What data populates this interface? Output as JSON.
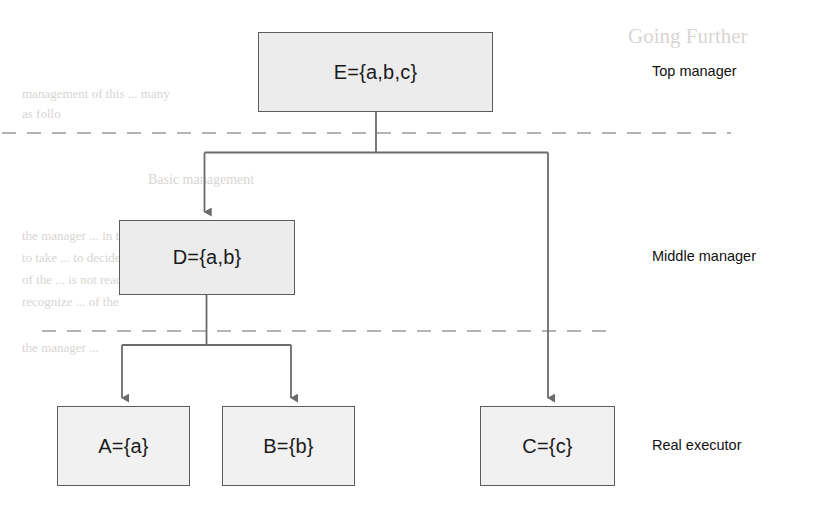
{
  "diagram": {
    "nodes": [
      {
        "id": "E",
        "label": "E={a,b,c}",
        "tier": "top"
      },
      {
        "id": "D",
        "label": "D={a,b}",
        "tier": "middle"
      },
      {
        "id": "A",
        "label": "A={a}",
        "tier": "bottom"
      },
      {
        "id": "B",
        "label": "B={b}",
        "tier": "bottom"
      },
      {
        "id": "C",
        "label": "C={c}",
        "tier": "bottom"
      }
    ],
    "tier_labels": [
      {
        "id": "top",
        "text": "Top manager"
      },
      {
        "id": "middle",
        "text": "Middle manager"
      },
      {
        "id": "bottom",
        "text": "Real executor"
      }
    ],
    "edges": [
      {
        "from": "E",
        "to": "D"
      },
      {
        "from": "E",
        "to": "C"
      },
      {
        "from": "D",
        "to": "A"
      },
      {
        "from": "D",
        "to": "B"
      }
    ],
    "colors": {
      "node_fill": "#ececec",
      "node_border": "#5c5c5c",
      "connector": "#6b6b6b",
      "divider": "#9a9a9a",
      "text": "#1a1a1a",
      "background": "#ffffff"
    },
    "dividers": [
      {
        "id": "top-middle-divider",
        "style": "dashed"
      },
      {
        "id": "middle-bottom-divider",
        "style": "dashed"
      }
    ]
  },
  "background_bleed": {
    "lines": [
      "Going Further",
      "management of this ... many",
      "as follo",
      "Basic management",
      "the manager ... in the system",
      "to take ... to decide whether",
      "of the ... is not ready, it should",
      "recognize ... of the",
      "the manager ..."
    ]
  }
}
